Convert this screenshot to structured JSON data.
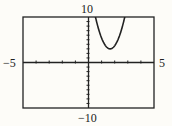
{
  "chart_data": {
    "type": "line",
    "title": "",
    "xlabel": "",
    "ylabel": "",
    "xlim": [
      -5,
      5
    ],
    "ylim": [
      -10,
      10
    ],
    "x_tick_step": 1,
    "y_tick_step": 1,
    "grid": false,
    "series": [
      {
        "name": "parabola",
        "equation": "y = 5.6(x - 1.65)^2 + 3 (estimated)",
        "vertex": [
          1.65,
          3
        ],
        "x": [
          0.55,
          0.8,
          1.0,
          1.2,
          1.4,
          1.65,
          1.9,
          2.1,
          2.3,
          2.5,
          2.75
        ],
        "y": [
          9.8,
          7.0,
          5.4,
          4.1,
          3.35,
          3.0,
          3.35,
          4.1,
          5.4,
          7.0,
          9.8
        ]
      }
    ],
    "labels": {
      "ymax": "10",
      "ymin": "-10",
      "xmin": "-5",
      "xmax": "5"
    }
  }
}
